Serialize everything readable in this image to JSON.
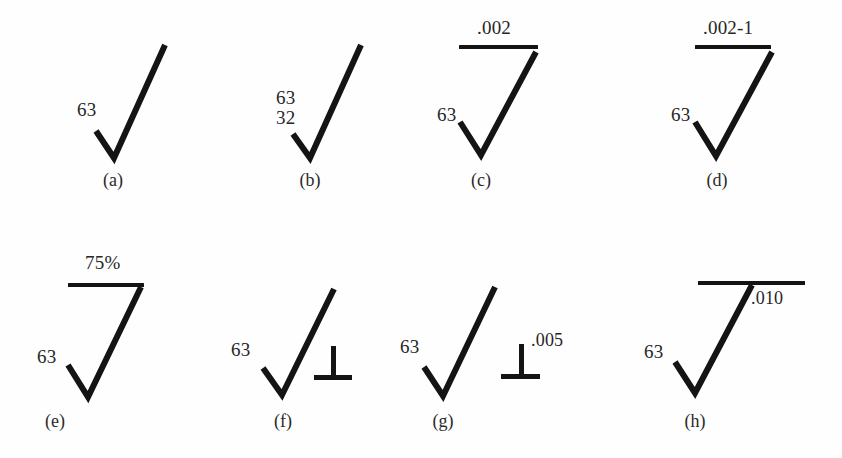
{
  "figure": {
    "background_color": "#fefefe",
    "ink_color": "#141414",
    "panels": [
      {
        "id": "a",
        "caption": "(a)",
        "left_label": "63",
        "stacked_label": null,
        "bar_label": null,
        "perp_label": null,
        "has_bar": false,
        "has_perpendicular": false
      },
      {
        "id": "b",
        "caption": "(b)",
        "left_label": "63",
        "stacked_label": "32",
        "bar_label": null,
        "perp_label": null,
        "has_bar": false,
        "has_perpendicular": false
      },
      {
        "id": "c",
        "caption": "(c)",
        "left_label": "63",
        "stacked_label": null,
        "bar_label": ".002",
        "perp_label": null,
        "has_bar": true,
        "has_perpendicular": false
      },
      {
        "id": "d",
        "caption": "(d)",
        "left_label": "63",
        "stacked_label": null,
        "bar_label": ".002-1",
        "perp_label": null,
        "has_bar": true,
        "has_perpendicular": false
      },
      {
        "id": "e",
        "caption": "(e)",
        "left_label": "63",
        "stacked_label": null,
        "bar_label": "75%",
        "perp_label": null,
        "has_bar": true,
        "has_perpendicular": false
      },
      {
        "id": "f",
        "caption": "(f)",
        "left_label": "63",
        "stacked_label": null,
        "bar_label": null,
        "perp_label": null,
        "has_bar": false,
        "has_perpendicular": true
      },
      {
        "id": "g",
        "caption": "(g)",
        "left_label": "63",
        "stacked_label": null,
        "bar_label": null,
        "perp_label": ".005",
        "has_bar": false,
        "has_perpendicular": true
      },
      {
        "id": "h",
        "caption": "(h)",
        "left_label": "63",
        "stacked_label": null,
        "bar_label": ".010",
        "perp_label": null,
        "has_bar": true,
        "has_perpendicular": false
      }
    ]
  }
}
